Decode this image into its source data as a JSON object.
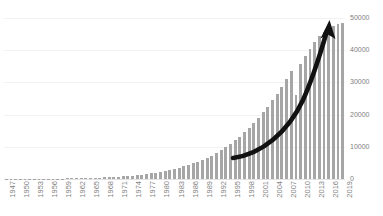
{
  "chart_data": {
    "type": "bar",
    "title": "",
    "subtitle": "",
    "xlabel": "",
    "ylabel": "",
    "ylim": [
      0,
      50000
    ],
    "grid": true,
    "legend": null,
    "bar_color": "#a6a6a6",
    "gridline_color": "#f2f2f2",
    "axis_text_color": "#7f7f7f",
    "y_ticks": [
      0,
      10000,
      20000,
      30000,
      40000,
      50000
    ],
    "y_tick_labels": [
      "0",
      "10000",
      "20000",
      "30000",
      "40000",
      "50000"
    ],
    "x_tick_labels": [
      "1947",
      "1950",
      "1953",
      "1956",
      "1959",
      "1962",
      "1965",
      "1968",
      "1971",
      "1974",
      "1977",
      "1980",
      "1983",
      "1986",
      "1989",
      "1992",
      "1995",
      "1998",
      "2001",
      "2004",
      "2007",
      "2010",
      "2013",
      "2016",
      "2019"
    ],
    "x_tick_step_years": 3,
    "categories": [
      "1947",
      "1948",
      "1949",
      "1950",
      "1951",
      "1952",
      "1953",
      "1954",
      "1955",
      "1956",
      "1957",
      "1958",
      "1959",
      "1960",
      "1961",
      "1962",
      "1963",
      "1964",
      "1965",
      "1966",
      "1967",
      "1968",
      "1969",
      "1970",
      "1971",
      "1972",
      "1973",
      "1974",
      "1975",
      "1976",
      "1977",
      "1978",
      "1979",
      "1980",
      "1981",
      "1982",
      "1983",
      "1984",
      "1985",
      "1986",
      "1987",
      "1988",
      "1989",
      "1990",
      "1991",
      "1992",
      "1993",
      "1994",
      "1995",
      "1996",
      "1997",
      "1998",
      "1999",
      "2000",
      "2001",
      "2002",
      "2003",
      "2004",
      "2005",
      "2006",
      "2007",
      "2008",
      "2009",
      "2010",
      "2011",
      "2012",
      "2013",
      "2014",
      "2015",
      "2016",
      "2017",
      "2018",
      "2019"
    ],
    "values": [
      20,
      25,
      30,
      35,
      40,
      50,
      60,
      70,
      80,
      95,
      110,
      130,
      150,
      175,
      200,
      230,
      265,
      300,
      345,
      395,
      450,
      510,
      580,
      660,
      750,
      850,
      960,
      1090,
      1230,
      1390,
      1570,
      1770,
      1990,
      2240,
      2510,
      2810,
      3140,
      3500,
      3900,
      4340,
      4830,
      5360,
      5950,
      6600,
      7300,
      8100,
      8950,
      9900,
      10900,
      12000,
      13200,
      14500,
      15900,
      17400,
      19000,
      20700,
      22500,
      24400,
      26500,
      28700,
      31000,
      33400,
      26000,
      35800,
      38200,
      40500,
      42600,
      44300,
      45700,
      46800,
      47500,
      48000,
      48500
    ],
    "annotation": {
      "type": "curved-arrow",
      "direction": "up-right",
      "color": "#111111",
      "description": "thick black upward curved growth arrow"
    }
  }
}
